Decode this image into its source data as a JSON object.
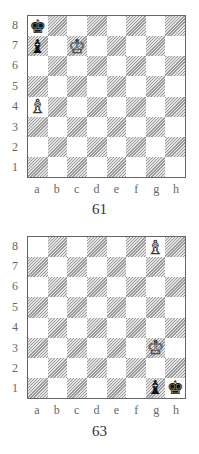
{
  "glyphs": {
    "white-king": "♔",
    "white-queen": "♕",
    "white-rook": "♖",
    "white-bishop": "♗",
    "white-knight": "♘",
    "white-pawn": "♙",
    "black-king": "♚",
    "black-queen": "♛",
    "black-rook": "♜",
    "black-bishop": "♝",
    "black-knight": "♞",
    "black-pawn": "♟"
  },
  "ranks": [
    "8",
    "7",
    "6",
    "5",
    "4",
    "3",
    "2",
    "1"
  ],
  "files": [
    "a",
    "b",
    "c",
    "d",
    "e",
    "f",
    "g",
    "h"
  ],
  "diagrams": [
    {
      "caption": "61",
      "pieces": [
        {
          "square": "a8",
          "piece": "black-king"
        },
        {
          "square": "a7",
          "piece": "black-bishop"
        },
        {
          "square": "c7",
          "piece": "white-king"
        },
        {
          "square": "a4",
          "piece": "white-bishop"
        }
      ]
    },
    {
      "caption": "63",
      "pieces": [
        {
          "square": "g8",
          "piece": "white-bishop"
        },
        {
          "square": "g3",
          "piece": "white-king"
        },
        {
          "square": "g1",
          "piece": "black-bishop"
        },
        {
          "square": "h1",
          "piece": "black-king"
        }
      ]
    }
  ]
}
